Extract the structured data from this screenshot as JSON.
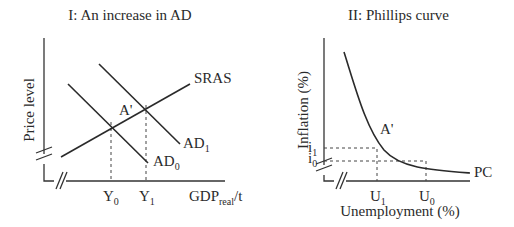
{
  "panels": [
    {
      "title": "I: An increase in AD",
      "y_axis_label": "Price level",
      "x_axis_label_main": "GDP",
      "x_axis_label_sub": "real",
      "x_axis_label_suffix": "/t",
      "curves": {
        "sras": "SRAS",
        "ad1_main": "AD",
        "ad1_sub": "1",
        "ad0_main": "AD",
        "ad0_sub": "0"
      },
      "point_label": "A'",
      "x_ticks": [
        {
          "main": "Y",
          "sub": "0"
        },
        {
          "main": "Y",
          "sub": "1"
        }
      ]
    },
    {
      "title": "II: Phillips curve",
      "y_axis_label": "Inflation (%)",
      "x_axis_label": "Unemployment (%)",
      "curves": {
        "pc": "PC"
      },
      "point_label": "A'",
      "y_ticks": [
        {
          "main": "i",
          "sub": "1"
        },
        {
          "main": "i",
          "sub": "0"
        }
      ],
      "x_ticks": [
        {
          "main": "U",
          "sub": "1"
        },
        {
          "main": "U",
          "sub": "0"
        }
      ]
    }
  ]
}
